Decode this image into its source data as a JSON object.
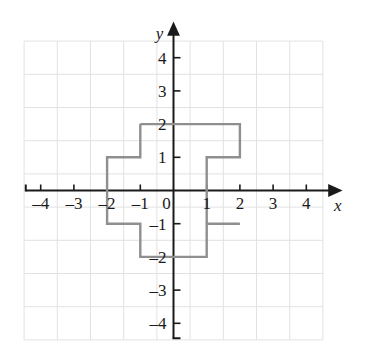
{
  "figure": {
    "kind": "coordinate-plane-graph",
    "background_color": "#ffffff",
    "grid_color": "#e2e2e2",
    "axis_color": "#1a1a1a",
    "shape_color": "#8f8f8f",
    "label_color": "#1a1a1a"
  },
  "axes": {
    "x_label": "x",
    "y_label": "y",
    "origin_label": "0",
    "x_ticks": [
      {
        "value": -4,
        "label": "–4"
      },
      {
        "value": -3,
        "label": "–3"
      },
      {
        "value": -2,
        "label": "–2"
      },
      {
        "value": -1,
        "label": "–1"
      },
      {
        "value": 1,
        "label": "1"
      },
      {
        "value": 2,
        "label": "2"
      },
      {
        "value": 3,
        "label": "3"
      },
      {
        "value": 4,
        "label": "4"
      }
    ],
    "y_ticks": [
      {
        "value": 4,
        "label": "4"
      },
      {
        "value": 3,
        "label": "3"
      },
      {
        "value": 2,
        "label": "2"
      },
      {
        "value": 1,
        "label": "1"
      },
      {
        "value": -1,
        "label": "–1"
      },
      {
        "value": -2,
        "label": "–2"
      },
      {
        "value": -3,
        "label": "–3"
      },
      {
        "value": -4,
        "label": "–4"
      }
    ]
  },
  "chart_data": {
    "type": "scatter",
    "title": "",
    "xlabel": "x",
    "ylabel": "y",
    "grid": true,
    "legend": "none",
    "xlim": [
      -4.5,
      4.5
    ],
    "ylim": [
      -4.5,
      4.5
    ],
    "xticks": [
      -4,
      -3,
      -2,
      -1,
      0,
      1,
      2,
      3,
      4
    ],
    "yticks": [
      -4,
      -3,
      -2,
      -1,
      0,
      1,
      2,
      3,
      4
    ],
    "grid_extent": {
      "x_min": -4.5,
      "x_max": 4.5,
      "y_min": -4.5,
      "y_max": 4.5
    },
    "series": [
      {
        "name": "plus-shape-polygon",
        "type": "closed-polygon",
        "stroke": "#8f8f8f",
        "fill": "none",
        "vertices": [
          [
            -1,
            2
          ],
          [
            2,
            2
          ],
          [
            2,
            1
          ],
          [
            2,
            -1
          ],
          [
            2,
            -1
          ],
          [
            1,
            -1
          ],
          [
            1,
            -2
          ],
          [
            -1,
            -2
          ],
          [
            -1,
            -1
          ],
          [
            -2,
            -1
          ],
          [
            -2,
            1
          ],
          [
            -1,
            1
          ]
        ],
        "path_points": [
          [
            -1,
            2
          ],
          [
            2,
            2
          ],
          [
            2,
            1
          ],
          [
            1,
            1
          ],
          [
            1,
            -1
          ],
          [
            2,
            -1
          ],
          [
            2,
            -1
          ],
          [
            1,
            -1
          ],
          [
            1,
            -2
          ],
          [
            -1,
            -2
          ],
          [
            -1,
            -1
          ],
          [
            -2,
            -1
          ],
          [
            -2,
            1
          ],
          [
            -1,
            1
          ],
          [
            -1,
            2
          ]
        ]
      }
    ]
  },
  "shape": {
    "name": "plus-cross-outline",
    "description": "cross shape outline",
    "segments": [
      {
        "from": [
          -1,
          2
        ],
        "to": [
          2,
          2
        ]
      },
      {
        "from": [
          2,
          2
        ],
        "to": [
          2,
          1
        ]
      },
      {
        "from": [
          2,
          1
        ],
        "to": [
          1,
          1
        ]
      },
      {
        "from": [
          1,
          1
        ],
        "to": [
          1,
          -1
        ]
      },
      {
        "from": [
          1,
          -1
        ],
        "to": [
          2,
          -1
        ]
      },
      {
        "from": [
          2,
          -1
        ],
        "to": [
          2,
          -1
        ]
      },
      {
        "from": [
          2,
          -1
        ],
        "to": [
          1,
          -1
        ]
      },
      {
        "from": [
          1,
          -1
        ],
        "to": [
          1,
          -2
        ]
      },
      {
        "from": [
          1,
          -2
        ],
        "to": [
          -1,
          -2
        ]
      },
      {
        "from": [
          -1,
          -2
        ],
        "to": [
          -1,
          -1
        ]
      },
      {
        "from": [
          -1,
          -1
        ],
        "to": [
          -2,
          -1
        ]
      },
      {
        "from": [
          -2,
          -1
        ],
        "to": [
          -2,
          1
        ]
      },
      {
        "from": [
          -2,
          1
        ],
        "to": [
          -1,
          1
        ]
      },
      {
        "from": [
          -1,
          1
        ],
        "to": [
          -1,
          2
        ]
      }
    ]
  }
}
